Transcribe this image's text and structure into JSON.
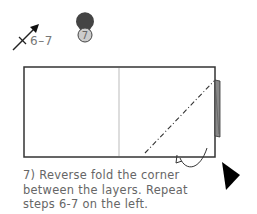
{
  "step": {
    "number": "7",
    "reference_label": "6–7"
  },
  "caption": {
    "lines": [
      "7) Reverse fold the corner",
      "between the layers. Repeat",
      "steps 6-7 on the left."
    ]
  },
  "colors": {
    "outline": "#333333",
    "center_line": "#bbbbbb",
    "badge_fill": "#cccccc",
    "text": "#666666",
    "arrow": "#000000"
  }
}
